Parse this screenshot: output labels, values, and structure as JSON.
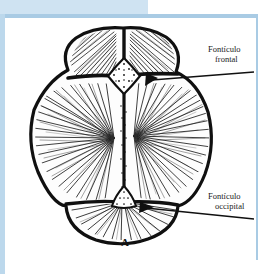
{
  "figure": {
    "caption": "A",
    "colors": {
      "page_accent": "#cfe3f2",
      "frame_border": "#bdd7ea",
      "ink": "#101010",
      "paper": "#ffffff"
    }
  },
  "labels": [
    {
      "name": "fonticulo-frontal",
      "line1": "Fontículo",
      "line2": "frontal"
    },
    {
      "name": "fonticulo-occipital",
      "line1": "Fontículo",
      "line2": "occipital"
    }
  ]
}
